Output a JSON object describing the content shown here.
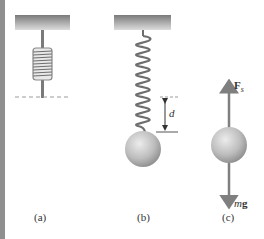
{
  "figure": {
    "panels": [
      {
        "id": "a",
        "label": "(a)",
        "description": "Spring unstretched, hanging from ceiling"
      },
      {
        "id": "b",
        "label": "(b)",
        "description": "Spring stretched by distance d with ball attached"
      },
      {
        "id": "c",
        "label": "(c)",
        "description": "Free-body diagram of ball"
      }
    ],
    "displacement_label": "d",
    "force_up_label": "F",
    "force_up_subscript": "s",
    "force_down_label_m": "m",
    "force_down_label_g": "g",
    "colors": {
      "ceiling_top": "#7a7a7a",
      "ceiling_bottom": "#d9d9d9",
      "spring": "#6e6e6e",
      "ball_light": "#e6e6e6",
      "ball_dark": "#8c8c8c",
      "arrow": "#7f7f7f",
      "dashed": "#9a9a9a",
      "stripe": "#8f8f8f"
    }
  }
}
